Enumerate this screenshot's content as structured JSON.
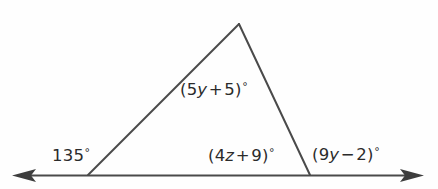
{
  "figure": {
    "name": "triangle-with-exterior-angles",
    "background_color": "#fefefe",
    "stroke_color": "#4a4a4a",
    "text_color": "#2b2b2b",
    "baseline_label": "horizontal-line-with-double-arrow"
  },
  "labels": {
    "top_angle": {
      "full_text": "(5y + 5)°",
      "open_paren": "(",
      "coefficient": "5",
      "variable": "y",
      "operator": "+",
      "constant": "5",
      "close_paren": ")",
      "degree": "°"
    },
    "left_angle": {
      "full_text": "135°",
      "value": "135",
      "degree": "°"
    },
    "bottom_angle": {
      "full_text": "(4z + 9)°",
      "open_paren": "(",
      "coefficient": "4",
      "variable": "z",
      "operator": "+",
      "constant": "9",
      "close_paren": ")",
      "degree": "°"
    },
    "right_angle": {
      "full_text": "(9y − 2)°",
      "open_paren": "(",
      "coefficient": "9",
      "variable": "y",
      "operator": "−",
      "constant": "2",
      "close_paren": ")",
      "degree": "°"
    }
  },
  "geometry": {
    "apex": {
      "x": 239,
      "y": 24
    },
    "base_left_vertex": {
      "x": 88,
      "y": 176
    },
    "base_right_vertex": {
      "x": 310,
      "y": 176
    },
    "line_left_end": {
      "x": 12,
      "y": 176
    },
    "line_right_end": {
      "x": 424,
      "y": 176
    }
  }
}
